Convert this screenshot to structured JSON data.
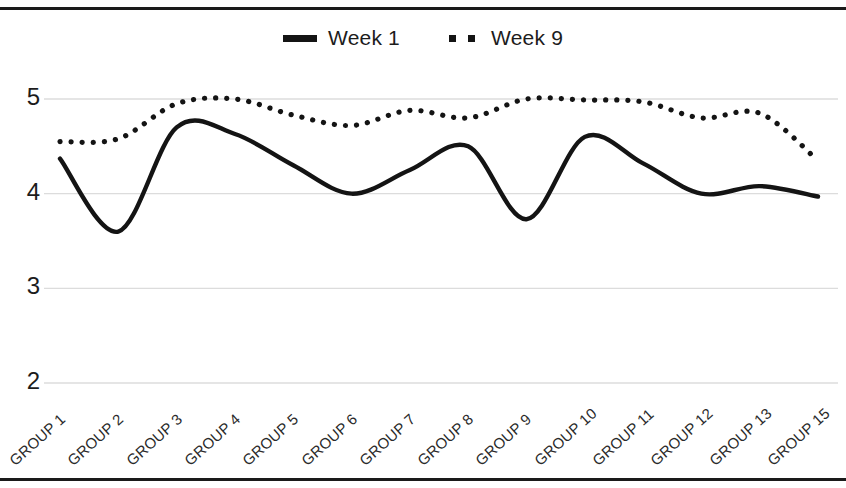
{
  "chart_data": {
    "type": "line",
    "title": "",
    "subtitle": "",
    "xlabel": "",
    "ylabel": "",
    "ylim": [
      2,
      5
    ],
    "yticks": [
      5,
      4,
      3,
      2
    ],
    "ytick_labels": [
      "5",
      "4",
      "3",
      "2"
    ],
    "grid": true,
    "grid_axis": "y",
    "legend_position": "top-center",
    "line_color": "#141414",
    "grid_color": "#dcdcdc",
    "background_color": "#ffffff",
    "smoothing": "spline",
    "categories": [
      "GROUP 1",
      "GROUP 2",
      "GROUP 3",
      "GROUP 4",
      "GROUP 5",
      "GROUP 6",
      "GROUP 7",
      "GROUP 8",
      "GROUP 9",
      "GROUP 10",
      "GROUP 11",
      "GROUP 12",
      "GROUP 13",
      "GROUP 15"
    ],
    "series": [
      {
        "name": "Week 1",
        "style": "solid",
        "values": [
          4.37,
          3.6,
          4.7,
          4.63,
          4.3,
          4.0,
          4.25,
          4.5,
          3.73,
          4.6,
          4.32,
          4.0,
          4.08,
          3.97
        ]
      },
      {
        "name": "Week 9",
        "style": "dotted",
        "values": [
          4.55,
          4.58,
          4.95,
          5.0,
          4.83,
          4.72,
          4.88,
          4.8,
          5.0,
          4.99,
          4.97,
          4.8,
          4.85,
          4.35
        ]
      }
    ]
  },
  "legend": {
    "entries": [
      {
        "label": "Week 1",
        "marker": "solid-line-swatch"
      },
      {
        "label": "Week 9",
        "marker": "dotted-line-swatch"
      }
    ]
  }
}
